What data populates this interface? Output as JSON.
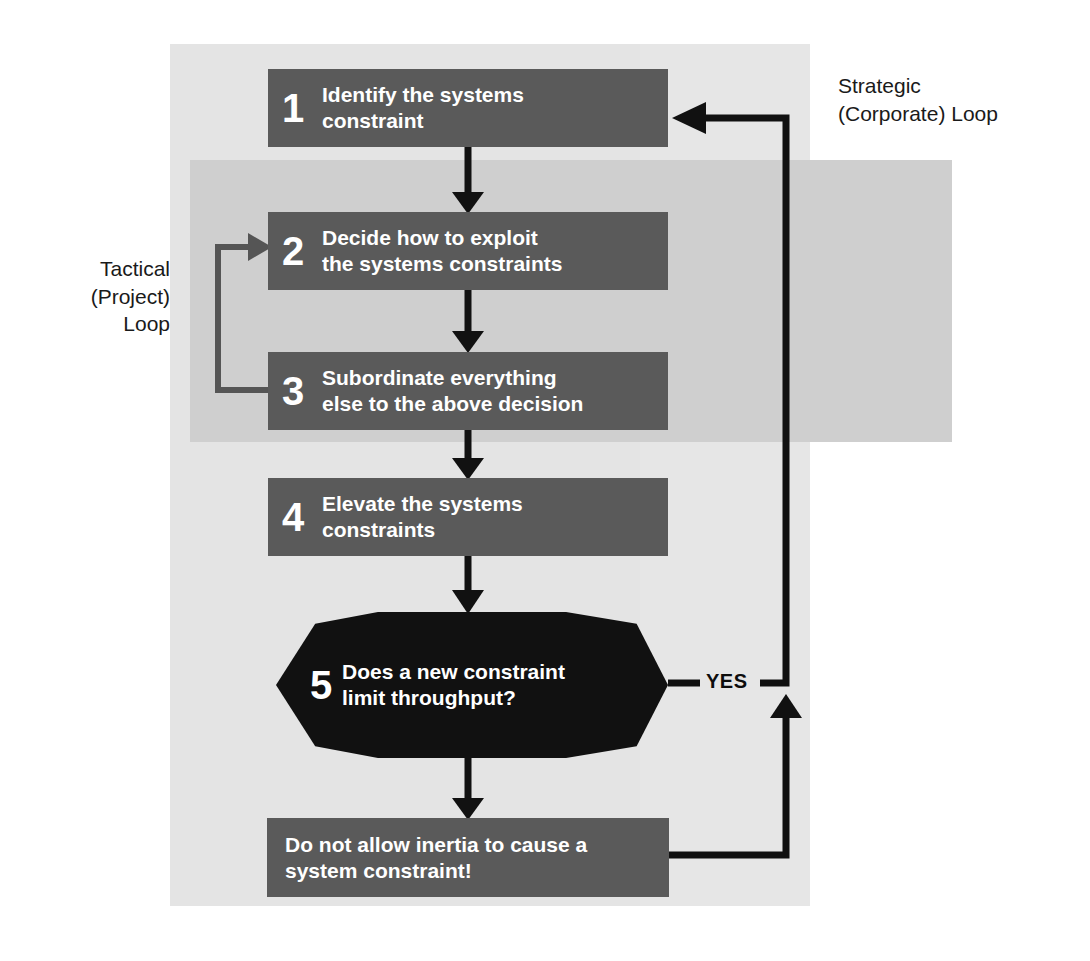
{
  "diagram": {
    "colors": {
      "box_fill": "#5a5a5a",
      "decision_fill": "#111111",
      "panel_bg": "#e6e6e6",
      "band_bg": "#cfcfcf",
      "box_text": "#ffffff",
      "label_text": "#1a1a1a",
      "connector": "#111111",
      "loop_connector": "#555555"
    },
    "steps": [
      {
        "number": "1",
        "text": "Identify the systems\nconstraint"
      },
      {
        "number": "2",
        "text": "Decide how to exploit\nthe systems constraints"
      },
      {
        "number": "3",
        "text": "Subordinate everything\nelse to the above decision"
      },
      {
        "number": "4",
        "text": "Elevate the systems\nconstraints"
      }
    ],
    "decision": {
      "number": "5",
      "text": "Does a new constraint\nlimit throughput?",
      "branch_label": "YES"
    },
    "final_box": {
      "text": "Do not allow inertia to cause a\nsystem constraint!"
    },
    "labels": {
      "tactical_loop": "Tactical\n(Project)\nLoop",
      "strategic_loop": "Strategic\n(Corporate) Loop"
    }
  }
}
